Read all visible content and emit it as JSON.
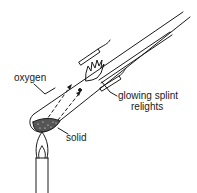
{
  "diagram": {
    "title": "",
    "type": "chemistry-apparatus",
    "labels": {
      "oxygen": "oxygen",
      "glowing_splint_line1": "glowing splint",
      "glowing_splint_line2": "relights",
      "solid": "solid"
    },
    "components": [
      {
        "name": "test-tube",
        "description": "tilted boiling tube"
      },
      {
        "name": "solid",
        "description": "dark granular solid at bottom of tube"
      },
      {
        "name": "bunsen-burner",
        "description": "burner with flame heating tube"
      },
      {
        "name": "glowing-splint",
        "description": "splint with flame inside tube mouth"
      },
      {
        "name": "clamp",
        "description": "clamp holding the tube"
      },
      {
        "name": "gas-flow-arrows",
        "description": "dashed arrows showing oxygen rising"
      }
    ],
    "colors": {
      "line": "#1a1a1a",
      "background": "#ffffff"
    }
  }
}
